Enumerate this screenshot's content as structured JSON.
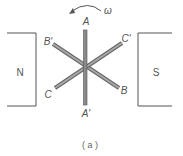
{
  "figure": {
    "caption": "( a )",
    "rotation": {
      "symbol": "ω",
      "direction": "counter-clockwise"
    },
    "magnets": {
      "left": {
        "label": "N"
      },
      "right": {
        "label": "S"
      }
    },
    "coils": [
      {
        "name": "A",
        "start_label": "A",
        "end_label": "A'"
      },
      {
        "name": "B",
        "start_label": "B'",
        "end_label": "B"
      },
      {
        "name": "C",
        "start_label": "C'",
        "end_label": "C"
      }
    ],
    "colors": {
      "line": "#555555",
      "coil_fill": "#9a9a9a",
      "coil_edge": "#666666"
    }
  }
}
